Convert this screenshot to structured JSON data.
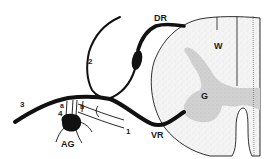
{
  "diagram": {
    "type": "anatomical-illustration",
    "colors": {
      "ink": "#111111",
      "white_matter": "#f2f2f2",
      "gray_matter": "#cfcfcf",
      "background": "#ffffff"
    },
    "labels": {
      "dorsal_root": "DR",
      "ventral_root": "VR",
      "white_matter": "W",
      "gray_matter": "G",
      "autonomic_ganglion": "AG",
      "branch_1": "1",
      "branch_2": "2",
      "branch_3": "3",
      "branch_4": "4",
      "ramus_a": "a",
      "ramus_b": "b"
    }
  }
}
